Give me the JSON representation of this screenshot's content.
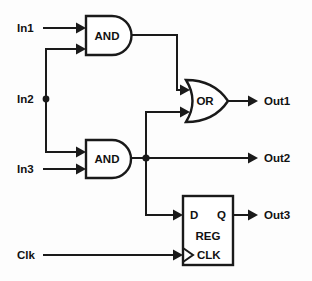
{
  "diagram": {
    "type": "logic-schematic",
    "background_color": "#fdfdfd",
    "line_color": "#1a1a1a",
    "inputs": [
      {
        "id": "in1",
        "label": "In1"
      },
      {
        "id": "in2",
        "label": "In2"
      },
      {
        "id": "in3",
        "label": "In3"
      },
      {
        "id": "clk",
        "label": "Clk"
      }
    ],
    "outputs": [
      {
        "id": "out1",
        "label": "Out1"
      },
      {
        "id": "out2",
        "label": "Out2"
      },
      {
        "id": "out3",
        "label": "Out3"
      }
    ],
    "gates": [
      {
        "id": "and1",
        "label": "AND",
        "kind": "and-gate"
      },
      {
        "id": "and2",
        "label": "AND",
        "kind": "and-gate"
      },
      {
        "id": "or1",
        "label": "OR",
        "kind": "or-gate"
      }
    ],
    "register": {
      "id": "reg1",
      "label": "REG",
      "kind": "register-block",
      "pins": {
        "d": "D",
        "q": "Q",
        "clk": "CLK"
      }
    }
  }
}
